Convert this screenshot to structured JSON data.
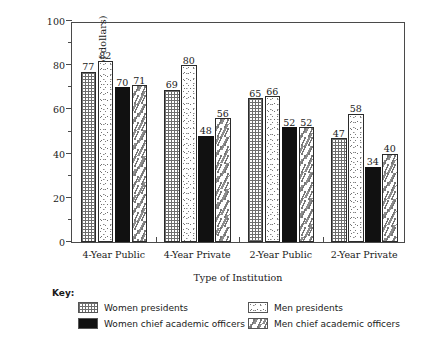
{
  "chart_data": {
    "type": "bar",
    "title": "",
    "xlabel": "Type of Institution",
    "ylabel": "Median Salary (in thousands of dollars)",
    "ylim": [
      0,
      100
    ],
    "ytick_major": [
      0,
      20,
      40,
      60,
      80,
      100
    ],
    "ytick_minor": [
      10,
      30,
      50,
      70,
      90
    ],
    "ytick_labels": [
      "0",
      "20",
      "40",
      "60",
      "80",
      "100"
    ],
    "grid": false,
    "legend_position": "below-plot",
    "legend_title": "Key:",
    "categories": [
      "4-Year Public",
      "4-Year Private",
      "2-Year Public",
      "2-Year Private"
    ],
    "series": [
      {
        "name": "Women presidents",
        "pattern": "checker",
        "values": [
          77,
          69,
          65,
          47
        ]
      },
      {
        "name": "Men presidents",
        "pattern": "stipple",
        "values": [
          82,
          80,
          66,
          58
        ]
      },
      {
        "name": "Women chief academic officers",
        "pattern": "solid-black",
        "values": [
          70,
          48,
          52,
          34
        ]
      },
      {
        "name": "Men chief academic officers",
        "pattern": "dash",
        "values": [
          71,
          56,
          52,
          40
        ]
      }
    ]
  },
  "colors": {
    "axis": "#4a4a4a",
    "text": "#1a1a1a",
    "solid_fill": "#111111",
    "pattern_ink": "#777777",
    "background": "#ffffff"
  }
}
